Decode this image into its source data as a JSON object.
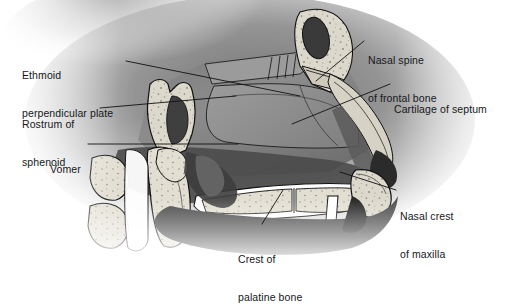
{
  "figure": {
    "type": "anatomical-illustration",
    "style": "grayscale halftone medical illustration",
    "width": 516,
    "height": 271,
    "background_color": "#ffffff",
    "bone_fill_color": "#d8d4c8",
    "cartilage_fill_color": "#8d8d8d",
    "soft_tissue_color": "#6a6a6a",
    "outline_color": "#111111",
    "label_text_color": "#15181b",
    "leader_line_color": "#111111"
  },
  "labels": [
    {
      "id": "ethmoid-perpendicular-plate",
      "line1": "Ethmoid",
      "line2": "perpendicular plate",
      "x": 22,
      "y": 44,
      "align": "left"
    },
    {
      "id": "rostrum-of-sphenoid",
      "line1": "Rostrum of",
      "line2": "sphenoid",
      "x": 22,
      "y": 93,
      "align": "left"
    },
    {
      "id": "vomer",
      "line1": "Vomer",
      "line2": "",
      "x": 50,
      "y": 138,
      "align": "left"
    },
    {
      "id": "nasal-spine-of-frontal-bone",
      "line1": "Nasal spine",
      "line2": "of frontal bone",
      "x": 368,
      "y": 29,
      "align": "left"
    },
    {
      "id": "cartilage-of-septum",
      "line1": "Cartilage of septum",
      "line2": "",
      "x": 394,
      "y": 78,
      "align": "left"
    },
    {
      "id": "nasal-crest-of-maxilla",
      "line1": "Nasal crest",
      "line2": "of maxilla",
      "x": 400,
      "y": 185,
      "align": "left"
    },
    {
      "id": "crest-of-palatine-bone",
      "line1": "Crest of",
      "line2": "palatine bone",
      "x": 238,
      "y": 228,
      "align": "left"
    }
  ]
}
